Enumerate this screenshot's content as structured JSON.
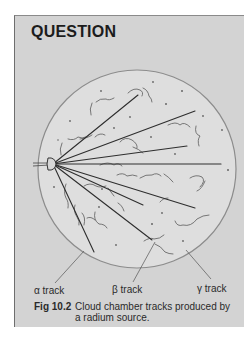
{
  "title": "QUESTION",
  "figure": {
    "number": "Fig 10.2",
    "caption": "Cloud chamber tracks produced by a radium source."
  },
  "labels": {
    "alpha": "α track",
    "beta": "β track",
    "gamma": "γ track"
  },
  "colors": {
    "panel_bg": "#d3d3d3",
    "chamber_bg": "#dedede",
    "chamber_outline": "#8c8c8c",
    "track_line": "#2e2e2e",
    "wisp": "#5a5a5a",
    "pointer": "#555555"
  },
  "diagram": {
    "chamber": {
      "cx": 137,
      "cy": 169,
      "r": 99
    },
    "source": {
      "x": 53,
      "y": 164
    },
    "tracks": [
      {
        "x2": 138,
        "y2": 95
      },
      {
        "x2": 195,
        "y2": 111
      },
      {
        "x2": 187,
        "y2": 146
      },
      {
        "x2": 221,
        "y2": 164
      },
      {
        "x2": 195,
        "y2": 208
      },
      {
        "x2": 143,
        "y2": 205
      },
      {
        "x2": 152,
        "y2": 240
      },
      {
        "x2": 94,
        "y2": 252
      }
    ],
    "pointers": [
      {
        "name": "alpha",
        "x1": 55,
        "y1": 283,
        "x2": 84,
        "y2": 251
      },
      {
        "name": "beta",
        "x1": 133,
        "y1": 282,
        "x2": 155,
        "y2": 242
      },
      {
        "name": "gamma",
        "x1": 211,
        "y1": 279,
        "x2": 186,
        "y2": 250
      }
    ]
  }
}
